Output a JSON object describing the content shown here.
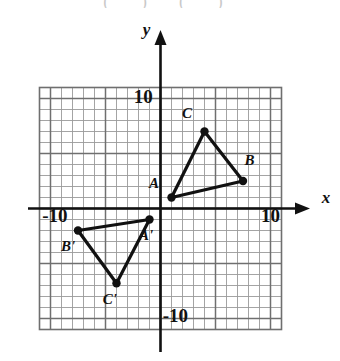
{
  "figure": {
    "title_fragment": "( )    ( )",
    "axes": {
      "x_label": "x",
      "y_label": "y",
      "ticks": {
        "x_positive": "10",
        "x_negative": "-10",
        "y_positive": "10",
        "y_negative": "-10"
      }
    },
    "grid": {
      "min_x": -11,
      "max_x": 11,
      "min_y": -11,
      "max_y": 11,
      "minor_step": 1,
      "major_step": 5,
      "minor_color": "#9a9a9a",
      "major_color": "#6f6f6f",
      "axis_color": "#111111",
      "shape_color": "#111111"
    }
  },
  "chart_data": {
    "type": "scatter",
    "title": "",
    "xlabel": "x",
    "ylabel": "y",
    "xlim": [
      -11,
      11
    ],
    "ylim": [
      -11,
      11
    ],
    "grid": true,
    "legend": "none",
    "series": [
      {
        "name": "Triangle ABC",
        "closed": true,
        "points": [
          {
            "label": "A",
            "x": 1,
            "y": 1,
            "label_dx": -1.6,
            "label_dy": 0.9
          },
          {
            "label": "C",
            "x": 4,
            "y": 7,
            "label_dx": -1.6,
            "label_dy": 1.2
          },
          {
            "label": "B",
            "x": 7.5,
            "y": 2.5,
            "label_dx": 0.6,
            "label_dy": 1.5
          }
        ]
      },
      {
        "name": "Triangle A'B'C'",
        "closed": true,
        "points": [
          {
            "label": "A'",
            "x": -1,
            "y": -1,
            "label_dx": -0.3,
            "label_dy": -1.9
          },
          {
            "label": "B'",
            "x": -7.5,
            "y": -2,
            "label_dx": -0.9,
            "label_dy": -1.9
          },
          {
            "label": "C'",
            "x": -4,
            "y": -6.8,
            "label_dx": -0.6,
            "label_dy": -1.9
          }
        ]
      }
    ]
  }
}
